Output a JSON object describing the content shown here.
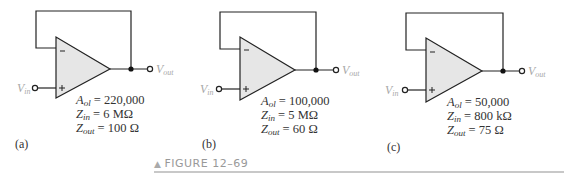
{
  "figure": {
    "caption": "FIGURE 12–69",
    "marker": "▲"
  },
  "circuits": [
    {
      "part": "(a)",
      "vin": "V",
      "vin_sub": "in",
      "vout": "V",
      "vout_sub": "out",
      "aol_sym": "A",
      "aol_sub": "ol",
      "aol_val": " = 220,000",
      "zin_sym": "Z",
      "zin_sub": "in",
      "zin_val": " = 6 MΩ",
      "zout_sym": "Z",
      "zout_sub": "out",
      "zout_val": " = 100 Ω"
    },
    {
      "part": "(b)",
      "vin": "V",
      "vin_sub": "in",
      "vout": "V",
      "vout_sub": "out",
      "aol_sym": "A",
      "aol_sub": "ol",
      "aol_val": " = 100,000",
      "zin_sym": "Z",
      "zin_sub": "in",
      "zin_val": " = 5 MΩ",
      "zout_sym": "Z",
      "zout_sub": "out",
      "zout_val": " = 60 Ω"
    },
    {
      "part": "(c)",
      "vin": "V",
      "vin_sub": "in",
      "vout": "V",
      "vout_sub": "out",
      "aol_sym": "A",
      "aol_sub": "ol",
      "aol_val": " = 50,000",
      "zin_sym": "Z",
      "zin_sub": "in",
      "zin_val": " = 800 kΩ",
      "zout_sym": "Z",
      "zout_sub": "out",
      "zout_val": " = 75 Ω"
    }
  ],
  "colors": {
    "opamp_fill": "#e6e6e6",
    "wire": "#222222",
    "terminal_label": "#a8a8a8",
    "rule": "#c8c8c8"
  }
}
